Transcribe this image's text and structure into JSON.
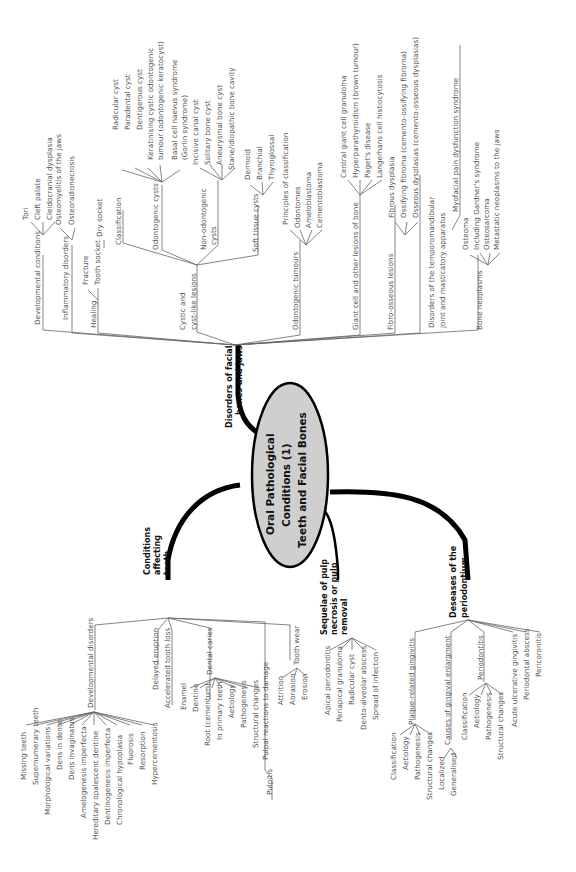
{
  "center": {
    "lines": [
      "Oral Pathological",
      "Conditions (1)",
      "Teeth and Facial Bones"
    ],
    "fill": "#cfcfcf"
  },
  "branches": {
    "facial": {
      "label_lines": [
        "Disorders of facial",
        "bones and jaws"
      ],
      "developmental": {
        "label": "Developmental conditions",
        "children": [
          "Tori",
          "Cleft palate",
          "Cleidocranial dysplasia"
        ]
      },
      "inflammatory": {
        "label": "Inflammatory disorders",
        "children": [
          "Osteomyelitis of the jaws",
          "Osteoradionecrosis"
        ]
      },
      "healing": {
        "label": "Healing",
        "children": [
          "Fracture",
          "Tooth socket"
        ],
        "socket_child": "Dry socket"
      },
      "cystic": {
        "label_lines": [
          "Cystic and",
          "cyst-like lesions"
        ],
        "classification": "Classification",
        "odontogenic": {
          "label": "Odontogenic cysts",
          "children": [
            "Radicular cyst",
            "Paradental cyst",
            "Dentigerous cyst",
            "Keratinising cystic odontogenic",
            "tumour (odontogenic keratocyst)",
            "Basal cell naevus syndrome",
            "(Gorlin syndrome)"
          ]
        },
        "non_odontogenic": {
          "label_lines": [
            "Non-odontogenic",
            "cysts"
          ],
          "children": [
            "Incisive canal cyst",
            "Solitary bone cyst",
            "Aneurysmal bone cyst",
            "Stane/idiopathic bone cavity"
          ]
        },
        "soft_tissue": {
          "label": "Soft tissue cysts",
          "children": [
            "Dermoid",
            "Branchial",
            "Thyroglossal"
          ]
        }
      },
      "odontogenic_tumours": {
        "label": "Odontogenic tumours",
        "children": [
          "Principles of classification",
          "Odontomes",
          "Ameloblastoma",
          "Cementoblastoma"
        ]
      },
      "giant_cell": {
        "label": "Giant cell and other lesions of bone",
        "children": [
          "Central giant cell granuloma",
          "Hyperparathyroidism (brown tumour)",
          "Paget's disease",
          "Langerhans cell histiocytosis"
        ]
      },
      "fibro_osseous": {
        "label": "Fibro-osseous lesions",
        "children": [
          "Fibrous dysplasia",
          "Ossifying fibroma (cemento-ossifying fibroma)",
          "Osseous dysplasias (cemento-osseous dysplasias)"
        ]
      },
      "tmj": {
        "label_lines": [
          "Disorders of the temporomandibular",
          "joint and masticatory apparatus"
        ],
        "child": "Myofacial pain dysfunction syndrome"
      },
      "bone_neoplasms": {
        "label": "Bone neoplasms",
        "children": [
          "Osteoma",
          "Including Gardner's syndrome",
          "Osteosarcoma",
          "Metastatic neoplasms to the jaws"
        ]
      }
    },
    "teeth": {
      "label_lines": [
        "Conditions",
        "affecting",
        "teeth"
      ],
      "developmental": {
        "label": "Developmental disorders",
        "children": [
          "Missing teeth",
          "Supernumerary teeth",
          "Morphological variations",
          "Dens in dente",
          "Dens invaginatus",
          "Amelogenesis imperfecta",
          "Hereditary opalescent dentine",
          "Dentinogenesis imperfecta",
          "Chronological hypoplasia",
          "Fluorosis",
          "Resorption",
          "Hypercementosis"
        ]
      },
      "delayed": "Delayed eruption",
      "accelerated": "Accelerated tooth loss",
      "caries": {
        "label": "Dental caries",
        "children": [
          "Enamel",
          "Dentine",
          "Root (cementum)",
          "In primary teeth",
          "Aetiology",
          "Pathogenesis",
          "Structural changes"
        ]
      },
      "pulpal": {
        "label": "Pulpal reactions to damage",
        "children": [
          "Pulpitis"
        ]
      },
      "wear": {
        "label": "Tooth wear",
        "children": [
          "Attrition",
          "Abrasion",
          "Erosion"
        ]
      }
    },
    "pulp": {
      "label_lines": [
        "Sequelae of pulp",
        "necrosis or pulp",
        "removal"
      ],
      "children": [
        "Apical periodontitis",
        "Periapical granuloma",
        "Radicular cyst",
        "Dento-alveolar abscess",
        "Spread of infection"
      ]
    },
    "perio": {
      "label_lines": [
        "Deseases of the",
        "periodontium"
      ],
      "plaque": {
        "label": "Plaque-related gingivitis",
        "children": [
          "Classification",
          "Aetiology",
          "Pathogenesis",
          "Structural changes"
        ]
      },
      "enlargement": {
        "label": "Causes of gingival enlargment",
        "children": [
          "Localized",
          "Generalised"
        ]
      },
      "periodontitis": {
        "label": "Periodontitis",
        "children": [
          "Classification",
          "Aetiology",
          "Pathogenesis",
          "Structural changes"
        ]
      },
      "others": [
        "Acute ulcerative gingivitis",
        "Periodontal abscess",
        "Pericoronitis"
      ]
    }
  }
}
